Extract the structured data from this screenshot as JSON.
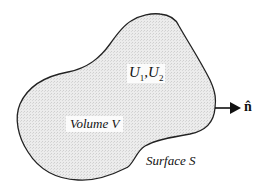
{
  "diagram": {
    "type": "region-with-boundary",
    "region": {
      "label": "Volume V",
      "fill": "#e4e4e4",
      "stroke": "#222222"
    },
    "fields": {
      "symbol": "U",
      "sub1": "1",
      "sub2": "2",
      "separator": ","
    },
    "boundary": {
      "label": "Surface S"
    },
    "normal": {
      "label": "n̂",
      "description": "outward unit normal"
    }
  }
}
